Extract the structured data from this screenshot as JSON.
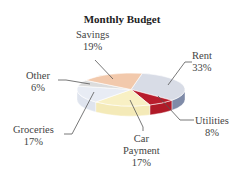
{
  "chart_data": {
    "type": "pie",
    "title": "Monthly Budget",
    "style": "3d",
    "categories": [
      "Rent",
      "Utilities",
      "Car Payment",
      "Groceries",
      "Other",
      "Savings"
    ],
    "values": [
      33,
      8,
      17,
      17,
      6,
      19
    ],
    "unit": "%",
    "colors": {
      "Rent": "#d8dce6",
      "Utilities": "#b81c2c",
      "Car Payment": "#f8f0c4",
      "Groceries": "#e8ecf4",
      "Other": "#dcdcdc",
      "Savings": "#f2c9ac"
    },
    "side_colors": {
      "Rent": "#7f8ba8",
      "Utilities": "#b01a28",
      "Car Payment": "#f4eab8",
      "Groceries": "#dfe4ee",
      "Other": "#d0d0d0",
      "Savings": "#e8b898"
    },
    "labels": [
      {
        "name": "Rent",
        "line1": "Rent",
        "line2": "33%"
      },
      {
        "name": "Utilities",
        "line1": "Utilities",
        "line2": "8%"
      },
      {
        "name": "Car Payment",
        "line1": "Car",
        "line2": "Payment",
        "line3": "17%"
      },
      {
        "name": "Groceries",
        "line1": "Groceries",
        "line2": "17%"
      },
      {
        "name": "Other",
        "line1": "Other",
        "line2": "6%"
      },
      {
        "name": "Savings",
        "line1": "Savings",
        "line2": "19%"
      }
    ],
    "legend": "none (leader-line labels)"
  }
}
